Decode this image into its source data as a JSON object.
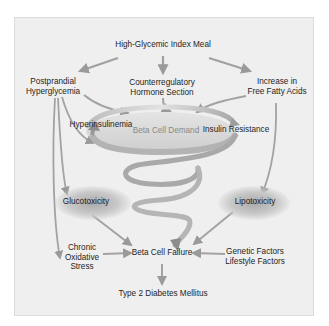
{
  "diagram": {
    "title": "High-Glycemic Index Meal",
    "nodes": {
      "meal": "High-Glycemic Index Meal",
      "postprandial": [
        "Postprandial",
        "Hyperglycemia"
      ],
      "counterregulatory": [
        "Counterregulatory",
        "Hormone Section"
      ],
      "fatty_acids": [
        "Increase in",
        "Free Fatty Acids"
      ],
      "hyperinsulinemia": "Hyperinsulinemia",
      "beta_cell_demand": "Beta Cell Demand",
      "insulin_resistance": "Insulin Resistance",
      "glucotoxicity": "Glucotoxicity",
      "lipotoxicity": "Lipotoxicity",
      "oxidative_stress": [
        "Chronic",
        "Oxidative",
        "Stress"
      ],
      "beta_cell_failure": "Beta Cell Failure",
      "genetic_lifestyle": [
        "Genetic Factors",
        "Lifestyle Factors"
      ],
      "t2dm": "Type 2 Diabetes Mellitus"
    },
    "edges": [
      {
        "from": "High-Glycemic Index Meal",
        "to": "Postprandial Hyperglycemia"
      },
      {
        "from": "High-Glycemic Index Meal",
        "to": "Counterregulatory Hormone Section"
      },
      {
        "from": "High-Glycemic Index Meal",
        "to": "Increase in Free Fatty Acids"
      },
      {
        "from": "Postprandial Hyperglycemia",
        "to": "Beta Cell Demand"
      },
      {
        "from": "Counterregulatory Hormone Section",
        "to": "Beta Cell Demand"
      },
      {
        "from": "Increase in Free Fatty Acids",
        "to": "Beta Cell Demand"
      },
      {
        "from": "Postprandial Hyperglycemia",
        "to": "Glucotoxicity"
      },
      {
        "from": "Postprandial Hyperglycemia",
        "to": "Chronic Oxidative Stress"
      },
      {
        "from": "Increase in Free Fatty Acids",
        "to": "Lipotoxicity"
      },
      {
        "from": "Insulin Resistance",
        "to": "Hyperinsulinemia"
      },
      {
        "from": "Beta Cell Demand",
        "to": "Beta Cell Failure"
      },
      {
        "from": "Glucotoxicity",
        "to": "Beta Cell Failure"
      },
      {
        "from": "Lipotoxicity",
        "to": "Beta Cell Failure"
      },
      {
        "from": "Chronic Oxidative Stress",
        "to": "Beta Cell Failure"
      },
      {
        "from": "Genetic Factors / Lifestyle Factors",
        "to": "Beta Cell Failure"
      },
      {
        "from": "Beta Cell Failure",
        "to": "Type 2 Diabetes Mellitus"
      }
    ],
    "colors": {
      "panel_bg": "#efefef",
      "arrow": "#9a9a9a",
      "spiral_light": "#d6d6d6",
      "spiral_dark": "#8e8e8e",
      "text": "#1e1e1e",
      "faint_text": "#8a8a8a"
    }
  }
}
